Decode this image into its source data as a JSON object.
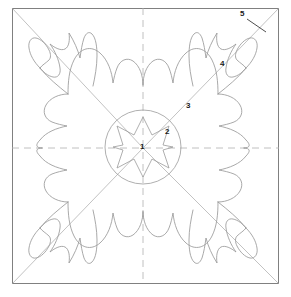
{
  "figure": {
    "type": "line-drawing",
    "background_color": "#ffffff",
    "line_color": "#9a9a9a",
    "frame_color": "#808080",
    "label_color": "#1a1a1a",
    "frame": {
      "x": 12,
      "y": 8,
      "width": 267,
      "height": 276
    },
    "fold_lines": {
      "vertical_x": 143,
      "horizontal_y": 148,
      "style": "dashed",
      "color": "#b0b0b0"
    },
    "diagonals": {
      "style": "solid-thin",
      "color": "#a8a8a8",
      "count": 4,
      "from_corners": true
    },
    "center": {
      "x": 143,
      "y": 147
    },
    "center_ellipse": {
      "cx": 143,
      "cy": 147,
      "rx": 38,
      "ry": 37
    },
    "center_star": {
      "points": 8,
      "outer_radius": 30,
      "inner_radius": 13
    }
  },
  "callouts": [
    {
      "id": "1",
      "label": "1",
      "x": 140,
      "y": 143
    },
    {
      "id": "2",
      "label": "2",
      "x": 165,
      "y": 128
    },
    {
      "id": "3",
      "label": "3",
      "x": 186,
      "y": 102
    },
    {
      "id": "4",
      "label": "4",
      "x": 220,
      "y": 60
    },
    {
      "id": "5",
      "label": "5",
      "x": 240,
      "y": 10
    }
  ],
  "leader_line": {
    "name": "callout-5-leader",
    "x1": 247,
    "y1": 19,
    "x2": 266,
    "y2": 32
  }
}
